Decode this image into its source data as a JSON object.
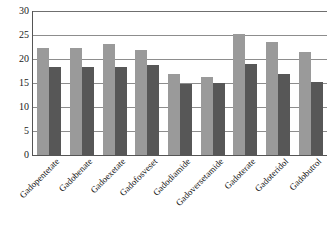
{
  "chart_data": {
    "type": "bar",
    "title": "",
    "subtitle": "",
    "xlabel": "",
    "ylabel": "",
    "ylim": [
      0,
      30
    ],
    "yticks": [
      0,
      5,
      10,
      15,
      20,
      25,
      30
    ],
    "ytick_labels": [
      "0",
      "5",
      "10",
      "15",
      "20",
      "25",
      "30"
    ],
    "grid": true,
    "legend": "none",
    "categories": [
      "Gadopentetate",
      "Gadobenate",
      "Gadoexetate",
      "Gadofosveset",
      "Gadodiamide",
      "Gadoversetamide",
      "Gadoterate",
      "Gadoteridol",
      "Gadobutrol"
    ],
    "series": [
      {
        "name": "series-1",
        "color": "#9a9a9a",
        "values": [
          22.3,
          22.3,
          23.2,
          21.9,
          16.8,
          16.3,
          25.2,
          23.5,
          21.5
        ]
      },
      {
        "name": "series-2",
        "color": "#575757",
        "values": [
          18.3,
          18.3,
          18.4,
          18.7,
          14.8,
          14.9,
          18.9,
          16.9,
          15.3
        ]
      }
    ]
  },
  "colors": {
    "series_1": "#9a9a9a",
    "series_2": "#575757",
    "gridline": "#8d8d8d",
    "axis": "#555555",
    "background": "#ffffff"
  }
}
